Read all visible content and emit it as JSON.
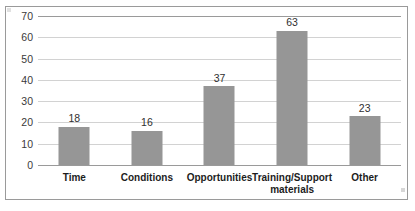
{
  "chart_data": {
    "type": "bar",
    "title": "",
    "xlabel": "",
    "ylabel": "",
    "categories": [
      "Time",
      "Conditions",
      "Opportunities",
      "Training/Support materials",
      "Other"
    ],
    "values": [
      18,
      16,
      37,
      63,
      23
    ],
    "ylim": [
      0,
      70
    ],
    "yticks": [
      0,
      10,
      20,
      30,
      40,
      50,
      60,
      70
    ],
    "ytick_labels": [
      "0",
      "10",
      "20",
      "30",
      "40",
      "50",
      "60",
      "70"
    ],
    "data_labels": [
      "18",
      "16",
      "37",
      "63",
      "23"
    ],
    "grid": true,
    "legend": false,
    "legend_position": "none",
    "series": [
      {
        "name": "",
        "values": [
          18,
          16,
          37,
          63,
          23
        ]
      }
    ],
    "colors": {
      "bar_fill": "#969696",
      "gridline": "#d2d2d2",
      "axis_line": "#9a9a9a",
      "frame_border": "#9a9a9a",
      "background": "#ffffff",
      "label_text": "#1d1d1d",
      "tick_text": "#3a3a3a"
    }
  }
}
